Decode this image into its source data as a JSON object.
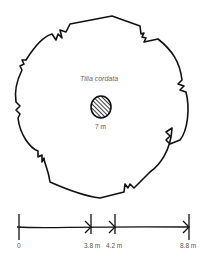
{
  "diagram": {
    "species_label": "Tilia cordata",
    "trunk_label": "7 m",
    "crown_shape": "irregular-circle",
    "trunk_shape": "hatched-circle"
  },
  "scale_bar": {
    "ticks": [
      {
        "label": "0",
        "x": 19
      },
      {
        "label": "3.8 m",
        "x": 91
      },
      {
        "label": "4.2 m",
        "x": 115
      },
      {
        "label": "8.8 m",
        "x": 189
      }
    ]
  },
  "colors": {
    "stroke": "#111111",
    "text": "#555555"
  }
}
